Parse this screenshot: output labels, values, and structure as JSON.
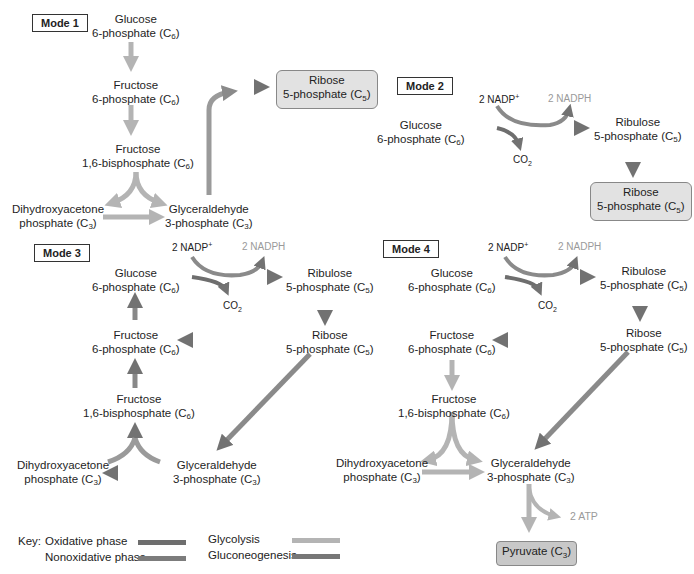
{
  "colors": {
    "oxidative": "#6e6e6e",
    "nonoxidative": "#7c7c7c",
    "glycolysis": "#b4b4b4",
    "gluconeogenesis": "#777777",
    "product_box": "#e2e2e2"
  },
  "mode1": {
    "label": "Mode 1",
    "g6p": {
      "name": "Glucose",
      "line2": "6-phosphate (C",
      "sub": "6",
      "close": ")"
    },
    "f6p": {
      "name": "Fructose",
      "line2": "6-phosphate (C",
      "sub": "6",
      "close": ")"
    },
    "f16bp": {
      "name": "Fructose",
      "line2": "1,6-bisphosphate (C",
      "sub": "6",
      "close": ")"
    },
    "dhap": {
      "name": "Dihydroxyacetone",
      "line2": "phosphate (C",
      "sub": "3",
      "close": ")"
    },
    "gap": {
      "name": "Glyceraldehyde",
      "line2": "3-phosphate (C",
      "sub": "3",
      "close": ")"
    },
    "r5p": {
      "name": "Ribose",
      "line2": "5-phosphate (C",
      "sub": "5",
      "close": ")"
    }
  },
  "mode2": {
    "label": "Mode 2",
    "nadp": "2 NADP",
    "nadp_sup": "+",
    "nadph": "2 NADPH",
    "co2": "CO",
    "co2_sub": "2",
    "g6p": {
      "name": "Glucose",
      "line2": "6-phosphate (C",
      "sub": "6",
      "close": ")"
    },
    "ru5p": {
      "name": "Ribulose",
      "line2": "5-phosphate (C",
      "sub": "5",
      "close": ")"
    },
    "r5p": {
      "name": "Ribose",
      "line2": "5-phosphate (C",
      "sub": "5",
      "close": ")"
    }
  },
  "mode3": {
    "label": "Mode 3",
    "nadp": "2 NADP",
    "nadp_sup": "+",
    "nadph": "2 NADPH",
    "co2": "CO",
    "co2_sub": "2",
    "g6p": {
      "name": "Glucose",
      "line2": "6-phosphate (C",
      "sub": "6",
      "close": ")"
    },
    "ru5p": {
      "name": "Ribulose",
      "line2": "5-phosphate (C",
      "sub": "5",
      "close": ")"
    },
    "f6p": {
      "name": "Fructose",
      "line2": "6-phosphate (C",
      "sub": "6",
      "close": ")"
    },
    "r5p": {
      "name": "Ribose",
      "line2": "5-phosphate (C",
      "sub": "5",
      "close": ")"
    },
    "f16bp": {
      "name": "Fructose",
      "line2": "1,6-bisphosphate (C",
      "sub": "6",
      "close": ")"
    },
    "dhap": {
      "name": "Dihydroxyacetone",
      "line2": "phosphate (C",
      "sub": "3",
      "close": ")"
    },
    "gap": {
      "name": "Glyceraldehyde",
      "line2": "3-phosphate (C",
      "sub": "3",
      "close": ")"
    }
  },
  "mode4": {
    "label": "Mode 4",
    "nadp": "2 NADP",
    "nadp_sup": "+",
    "nadph": "2 NADPH",
    "co2": "CO",
    "co2_sub": "2",
    "atp": "2 ATP",
    "g6p": {
      "name": "Glucose",
      "line2": "6-phosphate (C",
      "sub": "6",
      "close": ")"
    },
    "ru5p": {
      "name": "Ribulose",
      "line2": "5-phosphate (C",
      "sub": "5",
      "close": ")"
    },
    "f6p": {
      "name": "Fructose",
      "line2": "6-phosphate (C",
      "sub": "6",
      "close": ")"
    },
    "r5p": {
      "name": "Ribose",
      "line2": "5-phosphate (C",
      "sub": "5",
      "close": ")"
    },
    "f16bp": {
      "name": "Fructose",
      "line2": "1,6-bisphosphate (C",
      "sub": "6",
      "close": ")"
    },
    "dhap": {
      "name": "Dihydroxyacetone",
      "line2": "phosphate (C",
      "sub": "3",
      "close": ")"
    },
    "gap": {
      "name": "Glyceraldehyde",
      "line2": "3-phosphate (C",
      "sub": "3",
      "close": ")"
    },
    "pyruvate": {
      "name": "Pyruvate (C",
      "sub": "3",
      "close": ")"
    }
  },
  "key": {
    "title": "Key:",
    "items": [
      {
        "label": "Oxidative phase",
        "color": "#6e6e6e"
      },
      {
        "label": "Nonoxidative phase",
        "color": "#7c7c7c"
      },
      {
        "label": "Glycolysis",
        "color": "#b4b4b4"
      },
      {
        "label": "Gluconeogenesis",
        "color": "#777777"
      }
    ]
  }
}
